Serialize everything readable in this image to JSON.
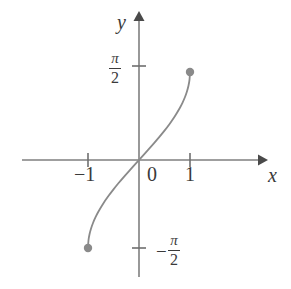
{
  "figure": {
    "caption": "",
    "background_color": "#ffffff",
    "axis_color": "#7f7f7f",
    "curve_color": "#8a8a8a",
    "point_color": "#8a8a8a",
    "text_color": "#3a3a3a"
  },
  "axes": {
    "x_axis_label": "x",
    "y_axis_label": "y",
    "origin_label": "0"
  },
  "ticks": {
    "x": [
      {
        "label": "−1",
        "value": -1
      },
      {
        "label": "1",
        "value": 1
      }
    ],
    "y": [
      {
        "numerator": "π",
        "denominator": "2",
        "sign": "",
        "value": 1.5708
      },
      {
        "numerator": "π",
        "denominator": "2",
        "sign": "−",
        "value": -1.5708
      }
    ]
  },
  "chart_data": {
    "type": "line",
    "title": "",
    "subtitle": "",
    "xlabel": "x",
    "ylabel": "y",
    "function": "y = arcsin(x)",
    "xlim": [
      -1,
      1
    ],
    "ylim": [
      -1.5708,
      1.5708
    ],
    "grid": false,
    "legend": null,
    "xticks": [
      -1,
      1
    ],
    "xticklabels": [
      "−1",
      "1"
    ],
    "yticks": [
      -1.5708,
      1.5708
    ],
    "yticklabels": [
      "−π/2",
      "π/2"
    ],
    "series": [
      {
        "name": "arcsin",
        "x": [
          -1,
          -0.99,
          -0.97,
          -0.94,
          -0.9,
          -0.85,
          -0.8,
          -0.7,
          -0.6,
          -0.5,
          -0.4,
          -0.3,
          -0.2,
          -0.1,
          0,
          0.1,
          0.2,
          0.3,
          0.4,
          0.5,
          0.6,
          0.7,
          0.8,
          0.85,
          0.9,
          0.94,
          0.97,
          0.99,
          1
        ],
        "y": [
          -1.5708,
          -1.4287,
          -1.3258,
          -1.2225,
          -1.1198,
          -1.016,
          -0.9273,
          -0.7754,
          -0.6435,
          -0.5236,
          -0.4115,
          -0.3047,
          -0.2014,
          -0.1002,
          0,
          0.1002,
          0.2014,
          0.3047,
          0.4115,
          0.5236,
          0.6435,
          0.7754,
          0.9273,
          1.016,
          1.1198,
          1.2225,
          1.3258,
          1.4287,
          1.5708
        ]
      }
    ],
    "endpoints": [
      {
        "x": -1,
        "y": -1.5708,
        "style": "filled-dot"
      },
      {
        "x": 1,
        "y": 1.5708,
        "style": "filled-dot"
      }
    ],
    "annotations": []
  }
}
